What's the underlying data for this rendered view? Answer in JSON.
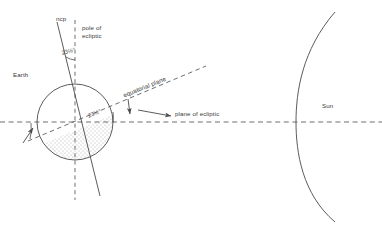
{
  "figure": {
    "background": "#ffffff",
    "line_color": "#4a4a4a",
    "text_color": "#3a3a3a"
  },
  "labels": {
    "ncp": "ncp",
    "pole_of_ecliptic": "pole of\necliptic",
    "earth": "Earth",
    "equatorial_plane": "equatorial plane",
    "plane_of_ecliptic": "plane of ecliptic",
    "sun": "Sun",
    "tilt_axis": "23½°",
    "tilt_plane": "23½°"
  },
  "diagram_data": {
    "type": "diagram",
    "obliquity_degrees": 23.5,
    "earth": {
      "center_x": 75,
      "center_y": 122,
      "radius": 38,
      "shaded_side": "left",
      "shading": "stippled"
    },
    "sun": {
      "limb_vertex_x": 296,
      "limb_vertex_y": 122,
      "shape": "arc"
    },
    "lines": [
      {
        "name": "pole-of-ecliptic",
        "style": "dashed",
        "orientation": "vertical",
        "x": 75,
        "y1": 20,
        "y2": 200
      },
      {
        "name": "plane-of-ecliptic",
        "style": "dashed",
        "orientation": "horizontal",
        "y": 122,
        "x1": 0,
        "x2": 382
      },
      {
        "name": "rotation-axis-ncp",
        "style": "solid",
        "x1": 57,
        "y1": 22,
        "x2": 100,
        "y2": 196
      },
      {
        "name": "equatorial-plane",
        "style": "dashed",
        "x1": 30,
        "y1": 146,
        "x2": 205,
        "y2": 72
      }
    ],
    "arrows": [
      {
        "name": "plane-of-ecliptic-arrow",
        "from_x": 140,
        "from_y": 112,
        "to_x": 172,
        "to_y": 116
      },
      {
        "name": "equatorial-plane-arrow",
        "from_x": 128,
        "from_y": 100,
        "to_x": 130,
        "to_y": 116
      },
      {
        "name": "tilt-angle-arrow-left",
        "from_x": 24,
        "from_y": 142,
        "to_x": 33,
        "to_y": 129
      }
    ]
  }
}
